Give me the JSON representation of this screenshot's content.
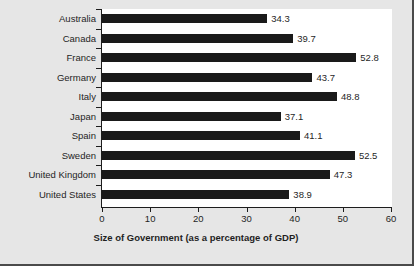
{
  "chart_data": {
    "type": "bar",
    "orientation": "horizontal",
    "title": "",
    "xlabel": "Size of Government (as a percentage of GDP)",
    "ylabel": "",
    "xlim": [
      0,
      60
    ],
    "xticks": [
      0,
      10,
      20,
      30,
      40,
      50,
      60
    ],
    "xtick_labels": [
      "0",
      "10",
      "20",
      "30",
      "40",
      "50",
      "60"
    ],
    "grid": false,
    "legend": false,
    "bar_color": "#1a1a1a",
    "plot_background": "#ffffff",
    "figure_background": "#e6e6e6",
    "categories": [
      "Australia",
      "Canada",
      "France",
      "Germany",
      "Italy",
      "Japan",
      "Spain",
      "Sweden",
      "United Kingdom",
      "United States"
    ],
    "values": [
      34.3,
      39.7,
      52.8,
      43.7,
      48.8,
      37.1,
      41.1,
      52.5,
      47.3,
      38.9
    ],
    "value_labels": [
      "34.3",
      "39.7",
      "52.8",
      "43.7",
      "48.8",
      "37.1",
      "41.1",
      "52.5",
      "47.3",
      "38.9"
    ]
  }
}
